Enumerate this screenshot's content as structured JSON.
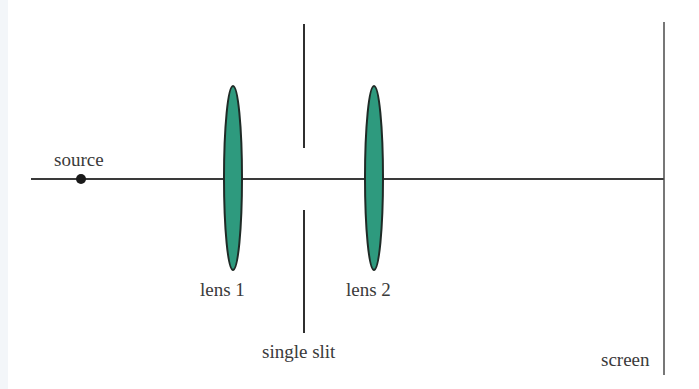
{
  "diagram": {
    "colors": {
      "line": "#3a3a3a",
      "lens_fill": "#2e9a7e",
      "lens_stroke": "#1f2a26",
      "text": "#3a3a3a"
    },
    "labels": {
      "source": "source",
      "lens1": "lens 1",
      "lens2": "lens 2",
      "slit": "single slit",
      "screen": "screen"
    },
    "elements": [
      {
        "id": "source",
        "type": "point-source",
        "x": 81,
        "y": 179
      },
      {
        "id": "lens1",
        "type": "converging-lens",
        "cx": 233,
        "cy": 178,
        "rx": 9,
        "ry": 92
      },
      {
        "id": "slit",
        "type": "single-slit",
        "x": 304,
        "upper": [
          24,
          148
        ],
        "lower": [
          210,
          333
        ]
      },
      {
        "id": "lens2",
        "type": "converging-lens",
        "cx": 374,
        "cy": 178,
        "rx": 9,
        "ry": 92
      },
      {
        "id": "screen",
        "type": "screen",
        "x": 664,
        "y1": 22,
        "y2": 375
      }
    ],
    "optical_axis": {
      "x1": 31,
      "x2": 664,
      "y": 179
    }
  }
}
